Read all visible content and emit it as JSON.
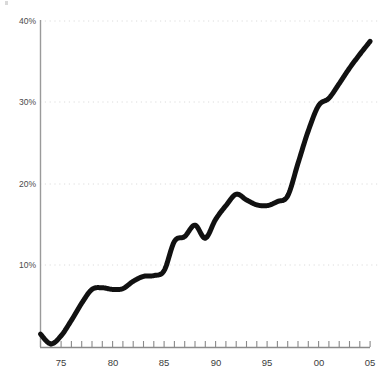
{
  "chart_data": {
    "type": "line",
    "title": "",
    "subtitle": "",
    "xlabel": "",
    "ylabel": "",
    "xlim": [
      1973,
      2005
    ],
    "ylim": [
      0,
      40
    ],
    "grid": true,
    "grid_axis": "y",
    "legend": false,
    "legend_position": "none",
    "y_tick_labels": [
      "40%",
      "30%",
      "20%",
      "10%"
    ],
    "y_tick_values": [
      40,
      30,
      20,
      10
    ],
    "x_tick_labels": [
      "75",
      "80",
      "85",
      "90",
      "95",
      "00",
      "05"
    ],
    "x_tick_values": [
      1975,
      1980,
      1985,
      1990,
      1995,
      2000,
      2005
    ],
    "x_minor_tick_interval": 1,
    "series": [
      {
        "name": "series-1",
        "color": "#111111",
        "line_width": 5,
        "x": [
          1973,
          1974,
          1975,
          1976,
          1977,
          1978,
          1979,
          1980,
          1981,
          1982,
          1983,
          1984,
          1985,
          1986,
          1987,
          1988,
          1989,
          1990,
          1991,
          1992,
          1993,
          1994,
          1995,
          1996,
          1997,
          1998,
          1999,
          2000,
          2001,
          2002,
          2003,
          2004,
          2005
        ],
        "values": [
          1.5,
          0.3,
          1.3,
          3.2,
          5.3,
          7.0,
          7.2,
          7.0,
          7.1,
          8.0,
          8.6,
          8.7,
          9.3,
          12.9,
          13.5,
          14.9,
          13.3,
          15.6,
          17.3,
          18.7,
          18.0,
          17.4,
          17.3,
          17.8,
          18.5,
          22.5,
          26.5,
          29.6,
          30.5,
          32.3,
          34.2,
          35.9,
          37.5
        ]
      }
    ]
  },
  "axes": {
    "y_axis_color": "#909090",
    "x_axis_color": "#8a8a8a",
    "gridline_color": "#dcdcdc",
    "tick_color": "#8a8a8a"
  },
  "marks": {
    "corner_mark_name": "top-left-artifact"
  }
}
